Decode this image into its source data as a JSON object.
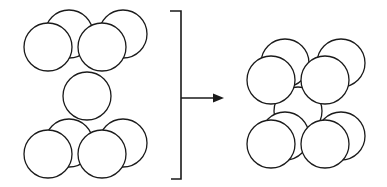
{
  "diagram": {
    "colors": {
      "stroke": "#1a1a1a",
      "fill": "#ffffff",
      "background": "#ffffff"
    },
    "left_group": {
      "label": "initial arrangement",
      "sphere_count": 9
    },
    "right_group": {
      "label": "final arrangement",
      "sphere_count": 9
    },
    "connector": {
      "type": "bracket-arrow",
      "direction": "right"
    }
  }
}
